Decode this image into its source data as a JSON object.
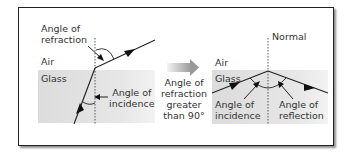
{
  "left_panel": {
    "label_refraction_1": "Angle of",
    "label_refraction_2": "refraction",
    "label_air": "Air",
    "label_glass": "Glass",
    "label_incidence_1": "Angle of",
    "label_incidence_2": "incidence"
  },
  "middle": {
    "line1": "Angle of",
    "line2": "refraction",
    "line3": "greater",
    "line4": "than 90°",
    "arrow_icon": "right-arrow-icon"
  },
  "right_panel": {
    "label_normal": "Normal",
    "label_air": "Air",
    "label_glass": "Glass",
    "label_incidence_1": "Angle of",
    "label_incidence_2": "incidence",
    "label_reflection_1": "Angle of",
    "label_reflection_2": "reflection"
  },
  "colors": {
    "glass": "#e0e0e0",
    "line": "#222222",
    "arrow_gradient_start": "#f2f2f2",
    "arrow_gradient_end": "#9a9a9a"
  }
}
